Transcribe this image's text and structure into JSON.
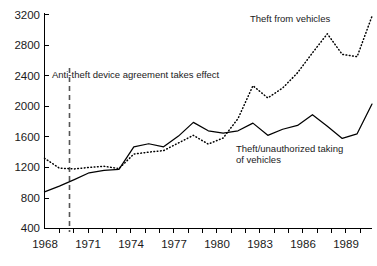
{
  "chart_data": {
    "type": "line",
    "title": "",
    "subtitle": "",
    "xlabel": "",
    "ylabel": "",
    "xlim": [
      1968,
      1990
    ],
    "ylim": [
      400,
      3200
    ],
    "grid": false,
    "legend_position": "inline-annotations",
    "y_ticks": [
      400,
      800,
      1200,
      1600,
      2000,
      2400,
      2800,
      3200
    ],
    "x_ticks": [
      1968,
      1971,
      1974,
      1977,
      1980,
      1983,
      1986,
      1989
    ],
    "x_tick_labels": [
      "1968",
      "1971",
      "1974",
      "1977",
      "1980",
      "1983",
      "1986",
      "1989"
    ],
    "y_tick_labels": [
      "400",
      "800",
      "1200",
      "1600",
      "2000",
      "2400",
      "2800",
      "3200"
    ],
    "x": [
      1968,
      1969,
      1970,
      1971,
      1972,
      1973,
      1974,
      1975,
      1976,
      1977,
      1978,
      1979,
      1980,
      1981,
      1982,
      1983,
      1984,
      1985,
      1986,
      1987,
      1988,
      1989,
      1990
    ],
    "series": [
      {
        "name": "Theft/unauthorized taking of vehicles",
        "style": "solid",
        "values": [
          880,
          955,
          1040,
          1130,
          1160,
          1175,
          1470,
          1510,
          1470,
          1610,
          1790,
          1680,
          1650,
          1680,
          1780,
          1620,
          1700,
          1750,
          1890,
          1740,
          1580,
          1640,
          2030
        ]
      },
      {
        "name": "Theft from vehicles",
        "style": "dotted",
        "values": [
          1320,
          1190,
          1180,
          1200,
          1215,
          1185,
          1375,
          1400,
          1420,
          1520,
          1620,
          1505,
          1585,
          1840,
          2270,
          2110,
          2240,
          2440,
          2700,
          2950,
          2680,
          2650,
          3180
        ]
      }
    ],
    "annotations": [
      {
        "id": "anti-theft-event",
        "text": "Anti-theft device agreement takes effect",
        "x_value": 1969.7,
        "marker": "vertical-dashed-line"
      },
      {
        "id": "series-label-theft-from-vehicles",
        "text": "Theft from vehicles"
      },
      {
        "id": "series-label-theft-of-vehicles-line1",
        "text": "Theft/unauthorized taking"
      },
      {
        "id": "series-label-theft-of-vehicles-line2",
        "text": "of vehicles"
      }
    ],
    "colors": {
      "axis": "#000000",
      "series_solid": "#000000",
      "series_dotted": "#000000",
      "event_line": "#555555",
      "background": "#ffffff",
      "text": "#1a1a1a"
    }
  }
}
